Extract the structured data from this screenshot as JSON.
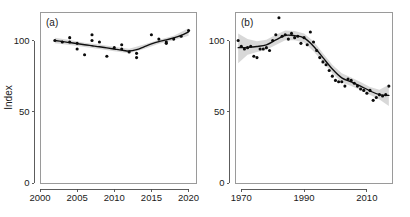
{
  "figure": {
    "width": 410,
    "height": 217,
    "background": "#ffffff",
    "point_color": "#0b0b0b",
    "line_color": "#101010",
    "band_color": "#d6d6d6",
    "axis_color": "#4a4a4a"
  },
  "chart_data": [
    {
      "type": "scatter",
      "panel_label": "(a)",
      "title": "",
      "xlabel": "",
      "ylabel": "Index",
      "xlim": [
        2000,
        2021
      ],
      "ylim": [
        0,
        120
      ],
      "xticks": [
        2000,
        2005,
        2010,
        2015,
        2020
      ],
      "xticklabels": [
        "2000",
        "2005",
        "2010",
        "2015",
        "2020"
      ],
      "yticks": [
        0,
        50,
        100
      ],
      "yticklabels": [
        "0",
        "50",
        "100"
      ],
      "grid": false,
      "legend": "none",
      "series": [
        {
          "name": "observations",
          "marker": "filled-circle",
          "x": [
            2002,
            2003,
            2004,
            2004,
            2005,
            2005,
            2006,
            2007,
            2007,
            2008,
            2009,
            2010,
            2011,
            2011,
            2012,
            2013,
            2013,
            2015,
            2016,
            2017,
            2017,
            2018,
            2019,
            2020
          ],
          "y": [
            100,
            99,
            102,
            99,
            98,
            94,
            90,
            104,
            100,
            99,
            89,
            95,
            97,
            94,
            92,
            91,
            88,
            104,
            101,
            99,
            98,
            101,
            103,
            107
          ]
        },
        {
          "name": "loess-trend",
          "type": "line",
          "x": [
            2002,
            2003,
            2004,
            2005,
            2006,
            2007,
            2008,
            2009,
            2010,
            2011,
            2012,
            2013,
            2014,
            2015,
            2016,
            2017,
            2018,
            2019,
            2020
          ],
          "y": [
            100.0,
            99.3,
            98.6,
            97.8,
            97.0,
            96.3,
            95.6,
            94.8,
            94.0,
            93.2,
            92.6,
            93.6,
            95.6,
            97.6,
            99.2,
            100.4,
            101.8,
            103.6,
            106.0
          ]
        },
        {
          "name": "confidence-band-upper",
          "x": [
            2002,
            2004,
            2006,
            2008,
            2010,
            2012,
            2014,
            2016,
            2018,
            2020
          ],
          "y": [
            102.0,
            100.4,
            98.5,
            97.2,
            95.6,
            94.2,
            97.2,
            100.6,
            103.4,
            108.6
          ]
        },
        {
          "name": "confidence-band-lower",
          "x": [
            2002,
            2004,
            2006,
            2008,
            2010,
            2012,
            2014,
            2016,
            2018,
            2020
          ],
          "y": [
            98.0,
            96.8,
            95.4,
            94.0,
            92.4,
            91.0,
            94.0,
            97.8,
            100.2,
            103.4
          ]
        }
      ]
    },
    {
      "type": "scatter",
      "panel_label": "(b)",
      "title": "",
      "xlabel": "",
      "ylabel": "",
      "xlim": [
        1968,
        2018
      ],
      "ylim": [
        0,
        120
      ],
      "xticks": [
        1970,
        1990,
        2010
      ],
      "xticklabels": [
        "1970",
        "1990",
        "2010"
      ],
      "yticks": [
        0,
        50,
        100
      ],
      "yticklabels": [
        "0",
        "50",
        "100"
      ],
      "grid": false,
      "legend": "none",
      "series": [
        {
          "name": "observations",
          "marker": "filled-circle",
          "x": [
            1969,
            1970,
            1971,
            1972,
            1973,
            1974,
            1975,
            1976,
            1977,
            1978,
            1979,
            1980,
            1981,
            1982,
            1983,
            1984,
            1985,
            1986,
            1987,
            1988,
            1989,
            1990,
            1991,
            1992,
            1993,
            1994,
            1995,
            1996,
            1997,
            1998,
            1999,
            2000,
            2001,
            2002,
            2003,
            2004,
            2005,
            2006,
            2007,
            2008,
            2009,
            2010,
            2011,
            2012,
            2013,
            2014,
            2015,
            2016,
            2017
          ],
          "y": [
            100,
            96,
            94,
            95,
            96,
            89,
            88,
            94,
            94,
            95,
            93,
            100,
            104,
            116,
            103,
            104,
            101,
            105,
            102,
            103,
            98,
            102,
            97,
            106,
            99,
            93,
            88,
            85,
            83,
            79,
            75,
            72,
            71,
            71,
            68,
            73,
            72,
            70,
            68,
            66,
            65,
            63,
            65,
            58,
            60,
            62,
            61,
            62,
            68
          ]
        },
        {
          "name": "loess-trend",
          "type": "line",
          "x": [
            1969,
            1972,
            1975,
            1978,
            1981,
            1984,
            1987,
            1990,
            1993,
            1996,
            1999,
            2002,
            2005,
            2008,
            2011,
            2014,
            2017
          ],
          "y": [
            95.0,
            95.2,
            95.8,
            97.0,
            100.4,
            103.6,
            103.4,
            101.8,
            96.0,
            88.0,
            80.0,
            73.8,
            71.0,
            68.0,
            64.6,
            62.0,
            61.5
          ]
        },
        {
          "name": "confidence-band-upper",
          "x": [
            1969,
            1972,
            1975,
            1978,
            1981,
            1984,
            1987,
            1990,
            1993,
            1996,
            1999,
            2002,
            2005,
            2008,
            2011,
            2014,
            2017
          ],
          "y": [
            105.0,
            101.0,
            99.5,
            100.5,
            104.0,
            107.0,
            106.6,
            105.0,
            99.5,
            91.0,
            83.0,
            77.0,
            74.0,
            70.8,
            67.4,
            65.4,
            69.0
          ]
        },
        {
          "name": "confidence-band-lower",
          "x": [
            1969,
            1972,
            1975,
            1978,
            1981,
            1984,
            1987,
            1990,
            1993,
            1996,
            1999,
            2002,
            2005,
            2008,
            2011,
            2014,
            2017
          ],
          "y": [
            84.0,
            90.0,
            92.0,
            93.5,
            96.8,
            100.2,
            100.2,
            98.6,
            92.5,
            85.0,
            77.0,
            70.6,
            68.0,
            65.2,
            61.8,
            58.6,
            54.0
          ]
        }
      ]
    }
  ],
  "layout": {
    "panel_a": {
      "x": 40,
      "y": 12,
      "width": 156,
      "height": 171
    },
    "panel_b": {
      "x": 235,
      "y": 12,
      "width": 157,
      "height": 171
    }
  }
}
